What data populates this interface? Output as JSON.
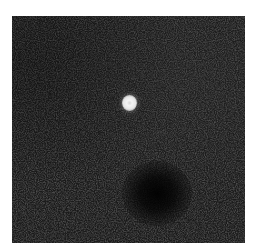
{
  "figure": {
    "top_fragment_text": "",
    "panel": {
      "background_color": "#1c1c1c",
      "bright_spot_color": "#f0f0f0",
      "dark_blob_color": "#050505"
    }
  }
}
